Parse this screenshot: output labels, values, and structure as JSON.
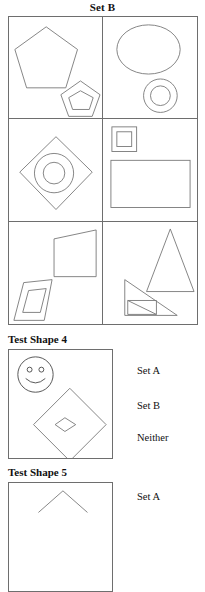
{
  "header": {
    "title": "Set B"
  },
  "set_grid": {
    "name": "set-b-shape-grid",
    "rows": 3,
    "columns": 2,
    "cells": [
      {
        "id": "cell-1",
        "position": "row1-left",
        "shapes": [
          "large-pentagon",
          "small-pentagon",
          "inner-pentagon"
        ]
      },
      {
        "id": "cell-2",
        "position": "row1-right",
        "shapes": [
          "large-circle",
          "small-circle",
          "inner-circle"
        ]
      },
      {
        "id": "cell-3",
        "position": "row2-left",
        "shapes": [
          "large-diamond",
          "circle",
          "inner-circle"
        ]
      },
      {
        "id": "cell-4",
        "position": "row2-right",
        "shapes": [
          "small-square",
          "inner-square",
          "large-rectangle"
        ]
      },
      {
        "id": "cell-5",
        "position": "row3-left",
        "shapes": [
          "large-quadrilateral",
          "small-parallelogram",
          "inner-quadrilateral"
        ]
      },
      {
        "id": "cell-6",
        "position": "row3-right",
        "shapes": [
          "large-triangle",
          "small-right-triangle",
          "inner-triangle"
        ]
      }
    ]
  },
  "test_shapes": [
    {
      "heading": "Test Shape 4",
      "shapes": [
        "smiley-face",
        "large-diamond",
        "inner-small-diamond"
      ],
      "options": [
        {
          "label": "Set A",
          "value": "set-a"
        },
        {
          "label": "Set B",
          "value": "set-b"
        },
        {
          "label": "Neither",
          "value": "neither"
        }
      ]
    },
    {
      "heading": "Test Shape 5",
      "shapes": [
        "chevron-partial"
      ],
      "options": [
        {
          "label": "Set A",
          "value": "set-a"
        }
      ]
    }
  ],
  "colors": {
    "stroke": "#6e6e6e",
    "shape_stroke": "#777777",
    "text": "#111111",
    "background": "#ffffff"
  }
}
